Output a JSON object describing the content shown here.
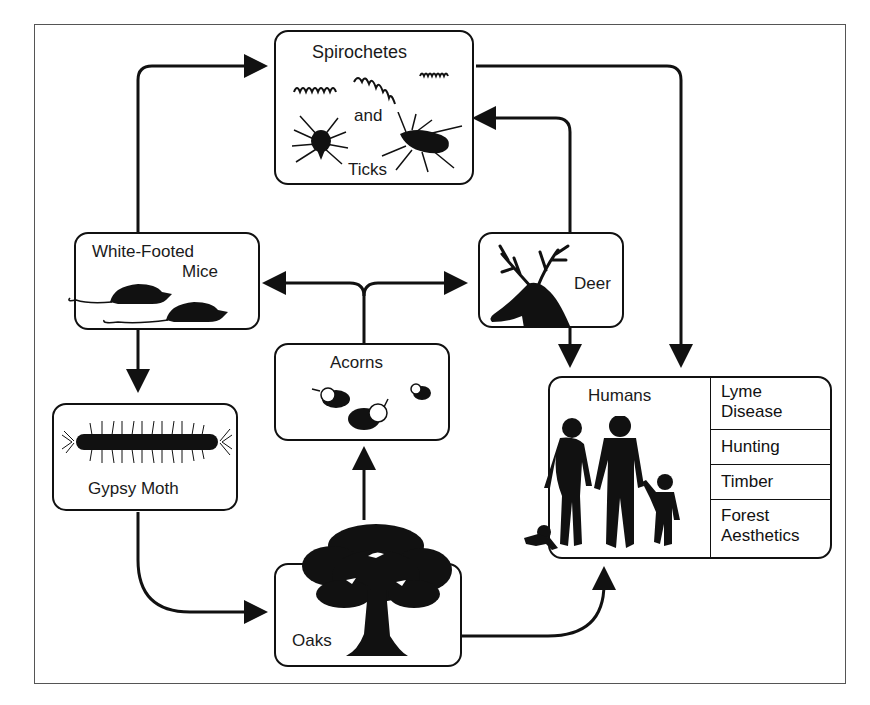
{
  "diagram": {
    "type": "ecological-interaction-web",
    "nodes": {
      "spirochetes_ticks": {
        "title_top": "Spirochetes",
        "title_mid": "and",
        "title_bottom": "Ticks"
      },
      "mice": {
        "title_line1": "White-Footed",
        "title_line2": "Mice"
      },
      "deer": {
        "title": "Deer"
      },
      "acorns": {
        "title": "Acorns"
      },
      "gypsy_moth": {
        "title": "Gypsy Moth"
      },
      "oaks": {
        "title": "Oaks"
      },
      "humans": {
        "title": "Humans",
        "impacts": [
          {
            "line1": "Lyme",
            "line2": "Disease"
          },
          {
            "line1": "Hunting",
            "line2": ""
          },
          {
            "line1": "Timber",
            "line2": ""
          },
          {
            "line1": "Forest",
            "line2": "Aesthetics"
          }
        ]
      }
    },
    "edges": [
      {
        "from": "White-Footed Mice",
        "to": "Spirochetes and Ticks"
      },
      {
        "from": "Spirochetes and Ticks",
        "to": "Humans"
      },
      {
        "from": "Deer",
        "to": "Spirochetes and Ticks"
      },
      {
        "from": "Deer",
        "to": "Humans"
      },
      {
        "from": "Acorns",
        "to": "White-Footed Mice"
      },
      {
        "from": "Acorns",
        "to": "Deer"
      },
      {
        "from": "White-Footed Mice",
        "to": "Gypsy Moth"
      },
      {
        "from": "Gypsy Moth",
        "to": "Oaks"
      },
      {
        "from": "Oaks",
        "to": "Acorns"
      },
      {
        "from": "Oaks",
        "to": "Humans"
      }
    ],
    "colors": {
      "line": "#111111",
      "background": "#ffffff",
      "frame": "#555555"
    }
  }
}
